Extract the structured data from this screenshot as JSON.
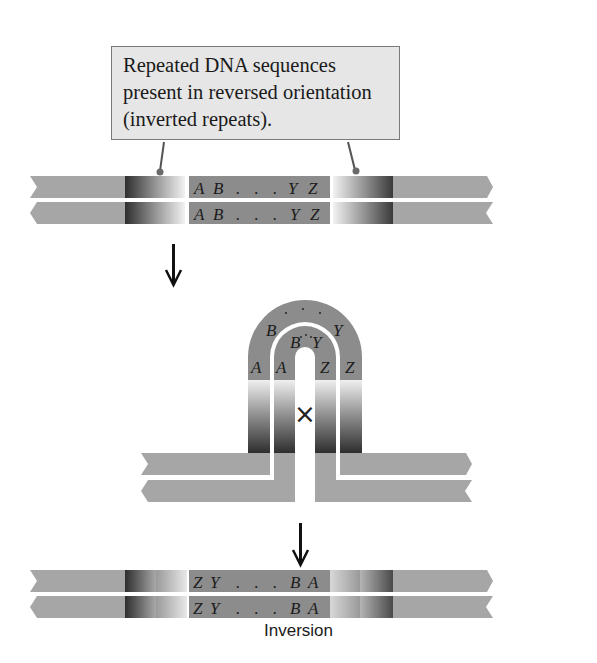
{
  "callout": {
    "lines": [
      "Repeated DNA sequences",
      "present in reversed orientation",
      "(inverted repeats)."
    ]
  },
  "before": {
    "strand_top": {
      "left": "A",
      "left2": "B",
      "dots": ". . .",
      "right2": "Y",
      "right": "Z"
    },
    "strand_bottom": {
      "left": "A",
      "left2": "B",
      "dots": ". . .",
      "right2": "Y",
      "right": "Z"
    }
  },
  "hairpin": {
    "outer": {
      "a": "A",
      "b": "B",
      "y": "Y",
      "z": "Z"
    },
    "inner": {
      "a": "A",
      "b": "B",
      "y": "Y",
      "z": "Z"
    },
    "crossover_symbol": "×"
  },
  "after": {
    "strand_top": {
      "left": "Z",
      "left2": "Y",
      "dots": ". . .",
      "right2": "B",
      "right": "A"
    },
    "strand_bottom": {
      "left": "Z",
      "left2": "Y",
      "dots": ". . .",
      "right2": "B",
      "right": "A"
    }
  },
  "caption": "Inversion",
  "colors": {
    "flank": "#a6a6a6",
    "repeat_dark": "#3c3c3c",
    "middle": "#8c8c8c",
    "callout_fill": "#e6e6e6",
    "arrow": "#111111"
  }
}
